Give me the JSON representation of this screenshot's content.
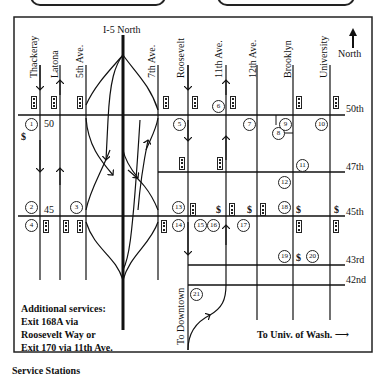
{
  "map": {
    "freeway_label": "I-5 North",
    "north_label": "North",
    "vertical_streets": [
      {
        "name": "Thackeray",
        "x": 40,
        "direction": "south"
      },
      {
        "name": "Latona",
        "x": 60,
        "direction": "north"
      },
      {
        "name": "5th Ave.",
        "x": 86,
        "direction": "two-way"
      },
      {
        "name": "7th Ave.",
        "x": 158,
        "direction": "two-way"
      },
      {
        "name": "Roosevelt",
        "x": 188,
        "direction": "south"
      },
      {
        "name": "11th Ave.",
        "x": 226,
        "direction": "north"
      },
      {
        "name": "12th Ave.",
        "x": 257,
        "direction": "two-way"
      },
      {
        "name": "Brooklyn",
        "x": 293,
        "direction": "two-way"
      },
      {
        "name": "University",
        "x": 330,
        "direction": "two-way"
      }
    ],
    "horizontal_streets": [
      {
        "name": "50th",
        "y": 115
      },
      {
        "name": "47th",
        "y": 172
      },
      {
        "name": "45th",
        "y": 216
      },
      {
        "name": "43rd",
        "y": 265
      },
      {
        "name": "42nd",
        "y": 285
      }
    ],
    "exit_labels": {
      "exit50": "50",
      "exit45": "45"
    },
    "numbered_locations": [
      "1",
      "2",
      "3",
      "4",
      "5",
      "6",
      "7",
      "8",
      "9",
      "10",
      "11",
      "12",
      "13",
      "14",
      "15",
      "16",
      "17",
      "18",
      "19",
      "20",
      "21"
    ],
    "dollar_symbol": "$",
    "to_downtown": "To Downtown",
    "to_downtown_arrow": "←",
    "to_uw": "To Univ. of Wash. ⟶",
    "notes": [
      "Additional services:",
      "Exit 168A via",
      "Roosevelt Way  or",
      "Exit 170 via 11th Ave."
    ],
    "caption_partial": "Service Stations"
  }
}
